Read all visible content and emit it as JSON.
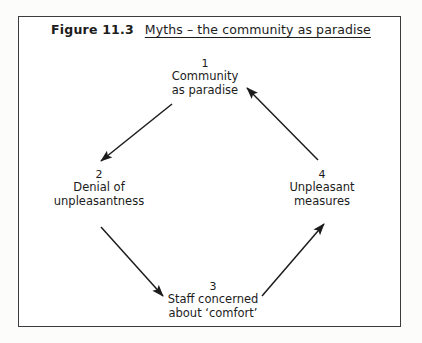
{
  "figure": {
    "number_label": "Figure 11.3",
    "caption": "Myths – the community as paradise",
    "frame_color": "#3b3b3b",
    "text_color": "#1c1c1c",
    "background_color": "#ffffff"
  },
  "diagram": {
    "type": "cycle",
    "direction": "clockwise",
    "nodes": [
      {
        "number": "1",
        "line1": "Community",
        "line2": "as paradise",
        "position": "top"
      },
      {
        "number": "2",
        "line1": "Denial of",
        "line2": "unpleasantness",
        "position": "left"
      },
      {
        "number": "3",
        "line1": "Staff concerned",
        "line2": "about ‘comfort’",
        "position": "bottom"
      },
      {
        "number": "4",
        "line1": "Unpleasant",
        "line2": "measures",
        "position": "right"
      }
    ],
    "arrows": [
      {
        "from": "1",
        "to": "2",
        "name": "arrow-1-to-2"
      },
      {
        "from": "2",
        "to": "3",
        "name": "arrow-2-to-3"
      },
      {
        "from": "3",
        "to": "4",
        "name": "arrow-3-to-4"
      },
      {
        "from": "4",
        "to": "1",
        "name": "arrow-4-to-1"
      }
    ]
  }
}
